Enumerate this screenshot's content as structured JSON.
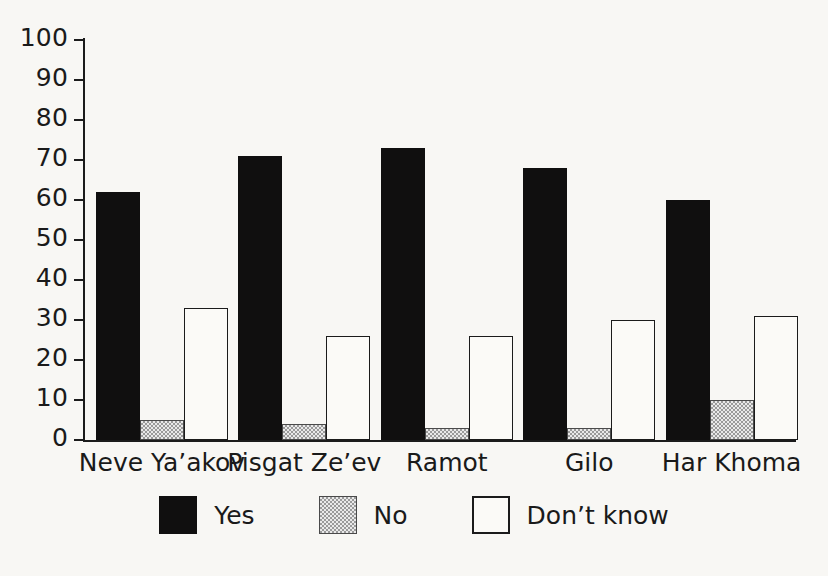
{
  "chart_data": {
    "type": "bar",
    "title": "",
    "subtitle": "",
    "xlabel": "",
    "ylabel": "",
    "ylim": [
      0,
      100
    ],
    "ytick_step": 10,
    "yticks": [
      "100",
      "90",
      "80",
      "70",
      "60",
      "50",
      "40",
      "30",
      "20",
      "10",
      "0"
    ],
    "grid": false,
    "legend_position": "bottom-center",
    "categories": [
      "Neve Ya’akov",
      "Pisgat Ze’ev",
      "Ramot",
      "Gilo",
      "Har Khoma"
    ],
    "series": [
      {
        "name": "Yes",
        "color": "#100f0f",
        "values": [
          62,
          71,
          73,
          68,
          60
        ]
      },
      {
        "name": "No",
        "color": "#c9c9c9",
        "values": [
          5,
          4,
          3,
          3,
          10
        ]
      },
      {
        "name": "Don’t know",
        "color": "#fbfaf7",
        "values": [
          33,
          26,
          26,
          30,
          31
        ]
      }
    ]
  },
  "legend": {
    "items": [
      {
        "label": "Yes",
        "swatch": "black-filled-square-icon"
      },
      {
        "label": "No",
        "swatch": "gray-hatched-square-icon"
      },
      {
        "label": "Don’t know",
        "swatch": "white-outlined-square-icon"
      }
    ]
  },
  "colors": {
    "yes": "#100f0f",
    "no": "#c9c9c9",
    "dont_know": "#fbfaf7",
    "axis": "#1b1b1b",
    "background": "#f8f7f4",
    "text": "#1a1a1a"
  }
}
